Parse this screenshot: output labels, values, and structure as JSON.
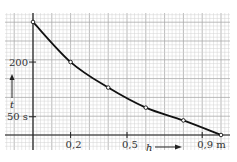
{
  "chart_data": {
    "type": "line",
    "title": "",
    "xlabel": "h",
    "ylabel": "t",
    "x_unit": "m",
    "y_unit": "s",
    "x": [
      0,
      0.2,
      0.4,
      0.6,
      0.8,
      1.0
    ],
    "series": [
      {
        "name": "t(h)",
        "values": [
          310,
          200,
          130,
          75,
          40,
          0
        ]
      }
    ],
    "x_ticks": [
      {
        "value": 0.2,
        "label": "0,2"
      },
      {
        "value": 0.5,
        "label": "0,5"
      },
      {
        "value": 0.9,
        "label": "0,9 m"
      }
    ],
    "y_ticks": [
      {
        "value": 200,
        "label": "200"
      },
      {
        "value": 50,
        "label": "50 s"
      }
    ],
    "xlim": [
      -0.15,
      1.05
    ],
    "ylim": [
      -40,
      335
    ],
    "grid": true,
    "markers": "open-circle",
    "line_color": "#111111",
    "grid_color": "#bdbdbd"
  }
}
